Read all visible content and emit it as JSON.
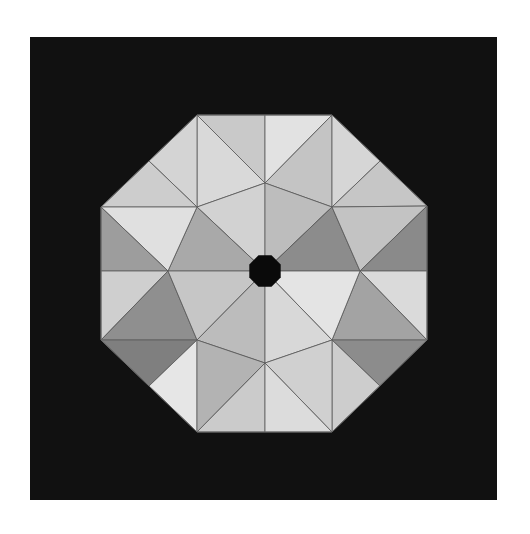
{
  "figure": {
    "background_color": "#ffffff",
    "panel": {
      "x": 30,
      "y": 37,
      "width": 467,
      "height": 463,
      "color": "#111111"
    },
    "center_hole": {
      "cx": 265,
      "cy": 271,
      "r": 17,
      "color": "#0a0a0a"
    },
    "facets": [
      {
        "points": "197,115 265,115 265,183",
        "fill": "#c9c9c9"
      },
      {
        "points": "265,115 332,115 265,183",
        "fill": "#e2e2e2"
      },
      {
        "points": "197,115 265,183 197,207",
        "fill": "#d9d9d9"
      },
      {
        "points": "332,115 332,207 265,183",
        "fill": "#c4c4c4"
      },
      {
        "points": "197,115 149,161 197,207",
        "fill": "#d4d4d4"
      },
      {
        "points": "149,161 101,207 197,207",
        "fill": "#cdcdcd"
      },
      {
        "points": "332,115 380,161 332,207",
        "fill": "#d6d6d6"
      },
      {
        "points": "380,161 427,206 332,207",
        "fill": "#c6c6c6"
      },
      {
        "points": "197,207 265,183 265,271",
        "fill": "#d2d2d2"
      },
      {
        "points": "265,183 332,207 265,271",
        "fill": "#bdbdbd"
      },
      {
        "points": "197,207 265,271 168,271",
        "fill": "#a9a9a9"
      },
      {
        "points": "332,207 360,271 265,271",
        "fill": "#8c8c8c"
      },
      {
        "points": "101,207 197,207 168,271",
        "fill": "#e0e0e0"
      },
      {
        "points": "101,207 168,271 101,271",
        "fill": "#9d9d9d"
      },
      {
        "points": "332,207 427,206 360,271",
        "fill": "#c3c3c3"
      },
      {
        "points": "427,206 427,271 360,271",
        "fill": "#8a8a8a"
      },
      {
        "points": "101,271 168,271 101,340",
        "fill": "#cfcfcf"
      },
      {
        "points": "168,271 197,340 101,340",
        "fill": "#8f8f8f"
      },
      {
        "points": "360,271 427,271 427,340",
        "fill": "#dadada"
      },
      {
        "points": "360,271 427,340 332,340",
        "fill": "#a3a3a3"
      },
      {
        "points": "168,271 265,271 197,340",
        "fill": "#c6c6c6"
      },
      {
        "points": "265,271 360,271 332,340",
        "fill": "#e4e4e4"
      },
      {
        "points": "197,340 265,271 265,363",
        "fill": "#bcbcbc"
      },
      {
        "points": "265,271 332,340 265,363",
        "fill": "#d8d8d8"
      },
      {
        "points": "101,340 149,386 197,340",
        "fill": "#7f7f7f"
      },
      {
        "points": "149,386 197,432 197,340",
        "fill": "#e6e6e6"
      },
      {
        "points": "427,340 380,386 332,340",
        "fill": "#8c8c8c"
      },
      {
        "points": "380,386 332,432 332,340",
        "fill": "#cdcdcd"
      },
      {
        "points": "197,340 265,363 197,432",
        "fill": "#b3b3b3"
      },
      {
        "points": "332,340 332,432 265,363",
        "fill": "#d0d0d0"
      },
      {
        "points": "197,432 265,363 265,432",
        "fill": "#cbcbcb"
      },
      {
        "points": "265,363 332,432 265,432",
        "fill": "#dcdcdc"
      }
    ]
  }
}
